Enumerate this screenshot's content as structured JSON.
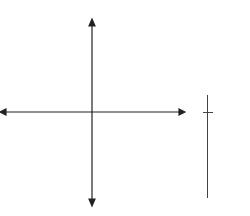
{
  "bottom_text": "x = 1",
  "table": {
    "headers": [
      "X",
      "Y"
    ],
    "rows": [
      [
        "0",
        "−1"
      ],
      [
        "1",
        "2"
      ],
      [
        "−1",
        "2"
      ],
      [
        "2",
        "11"
      ],
      [
        "−2",
        "11"
      ]
    ]
  },
  "chart_data": {
    "type": "line",
    "xlabel": "",
    "ylabel": "",
    "xlim": [
      -8,
      8
    ],
    "ylim": [
      -8,
      8
    ],
    "grid": true,
    "series": [
      {
        "name": "y = 3x² − 1",
        "x": [
          -2,
          -1,
          0,
          1,
          2
        ],
        "y": [
          11,
          2,
          -1,
          2,
          11
        ]
      }
    ],
    "table": {
      "columns": [
        "X",
        "Y"
      ],
      "rows": [
        [
          0,
          -1
        ],
        [
          1,
          2
        ],
        [
          -1,
          2
        ],
        [
          2,
          11
        ],
        [
          -2,
          11
        ]
      ]
    }
  }
}
